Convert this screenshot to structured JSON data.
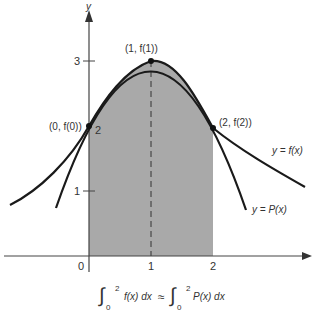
{
  "diagram": {
    "axes": {
      "x_label": "",
      "y_label": "y",
      "x_ticks": [
        "0",
        "1",
        "2"
      ],
      "y_ticks": [
        "1",
        "2",
        "3"
      ]
    },
    "points": [
      {
        "label": "(0, f(0))",
        "x": 0,
        "y": 2
      },
      {
        "label": "(1, f(1))",
        "x": 1,
        "y": 3
      },
      {
        "label": "(2, f(2))",
        "x": 2,
        "y": 1.98
      }
    ],
    "curves": [
      {
        "label": "y = f(x)",
        "description": "original function"
      },
      {
        "label": "y = P(x)",
        "description": "interpolating quadratic"
      }
    ],
    "shaded_region": {
      "from": 0,
      "to": 2,
      "color": "#a9a9a9"
    },
    "formula": {
      "lhs": "f(x) dx",
      "relation": "≈",
      "rhs": "P(x) dx",
      "lower": "0",
      "upper": "2"
    },
    "colors": {
      "curve": "#1a1a1a",
      "axis": "#444444",
      "shade": "#a9a9a9",
      "text": "#333333"
    }
  }
}
